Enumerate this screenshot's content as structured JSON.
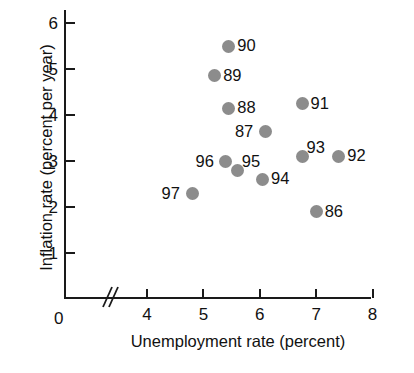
{
  "chart_data": {
    "type": "scatter",
    "title": "",
    "xlabel": "Unemployment rate (percent)",
    "ylabel": "Inflation rate (percent per year)",
    "xlim": [
      3.5,
      8.5
    ],
    "ylim": [
      0.6,
      6.4
    ],
    "xticks": [
      "4",
      "5",
      "6",
      "7",
      "8"
    ],
    "xtick_values": [
      4,
      5,
      6,
      7,
      8
    ],
    "yticks": [
      "1",
      "2",
      "3",
      "4",
      "5",
      "6"
    ],
    "ytick_values": [
      1,
      2,
      3,
      4,
      5,
      6
    ],
    "origin_label": "0",
    "grid": false,
    "legend": "none",
    "axis_break": "x-axis-break",
    "marker_color": "#8c8c8c",
    "axis_color": "#1a1a1a",
    "points": [
      {
        "label": "86",
        "x": 7.0,
        "y": 1.9,
        "label_side": "right"
      },
      {
        "label": "87",
        "x": 6.1,
        "y": 3.65,
        "label_side": "left"
      },
      {
        "label": "88",
        "x": 5.45,
        "y": 4.15,
        "label_side": "right"
      },
      {
        "label": "89",
        "x": 5.2,
        "y": 4.85,
        "label_side": "right"
      },
      {
        "label": "90",
        "x": 5.45,
        "y": 5.5,
        "label_side": "right"
      },
      {
        "label": "91",
        "x": 6.75,
        "y": 4.25,
        "label_side": "right"
      },
      {
        "label": "92",
        "x": 7.4,
        "y": 3.1,
        "label_side": "right"
      },
      {
        "label": "93",
        "x": 6.75,
        "y": 3.1,
        "label_side": "above-right"
      },
      {
        "label": "94",
        "x": 6.05,
        "y": 2.6,
        "label_side": "right"
      },
      {
        "label": "95",
        "x": 5.6,
        "y": 2.8,
        "label_side": "above-right"
      },
      {
        "label": "96",
        "x": 5.4,
        "y": 3.0,
        "label_side": "left"
      },
      {
        "label": "97",
        "x": 4.8,
        "y": 2.3,
        "label_side": "left"
      }
    ]
  }
}
